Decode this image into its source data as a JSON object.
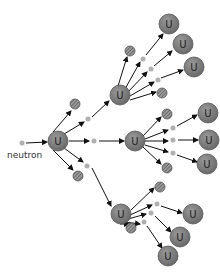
{
  "labels": {
    "neutron": "neutron"
  },
  "nucleus_symbol": "U",
  "colors": {
    "uranium_fill": "#7a7a7a",
    "uranium_stroke": "#555555",
    "neutron_fill": "#b0b0b0",
    "fragment_fill": "#8a8a8a",
    "arrow": "#111111"
  },
  "nodes": {
    "start_neutron": {
      "x": 22,
      "y": 143
    },
    "uranium": [
      {
        "id": "u0",
        "x": 58,
        "y": 141,
        "r": 10
      },
      {
        "id": "u1",
        "x": 120,
        "y": 95,
        "r": 10
      },
      {
        "id": "u2",
        "x": 135,
        "y": 141,
        "r": 10
      },
      {
        "id": "u3",
        "x": 121,
        "y": 214,
        "r": 10
      },
      {
        "id": "u4",
        "x": 169,
        "y": 24,
        "r": 10
      },
      {
        "id": "u5",
        "x": 183,
        "y": 44,
        "r": 10
      },
      {
        "id": "u6",
        "x": 194,
        "y": 67,
        "r": 10
      },
      {
        "id": "u7",
        "x": 208,
        "y": 113,
        "r": 10
      },
      {
        "id": "u8",
        "x": 209,
        "y": 140,
        "r": 10
      },
      {
        "id": "u9",
        "x": 207,
        "y": 164,
        "r": 10
      },
      {
        "id": "u10",
        "x": 193,
        "y": 214,
        "r": 10
      },
      {
        "id": "u11",
        "x": 180,
        "y": 237,
        "r": 10
      },
      {
        "id": "u12",
        "x": 168,
        "y": 256,
        "r": 10
      }
    ],
    "neutrons": [
      {
        "id": "n1",
        "x": 88,
        "y": 119
      },
      {
        "id": "n2",
        "x": 94,
        "y": 141
      },
      {
        "id": "n3",
        "x": 87,
        "y": 166
      },
      {
        "id": "n4",
        "x": 143,
        "y": 59
      },
      {
        "id": "n5",
        "x": 151,
        "y": 69
      },
      {
        "id": "n6",
        "x": 158,
        "y": 80
      },
      {
        "id": "n7",
        "x": 173,
        "y": 128
      },
      {
        "id": "n8",
        "x": 173,
        "y": 140
      },
      {
        "id": "n9",
        "x": 173,
        "y": 153
      },
      {
        "id": "n10",
        "x": 157,
        "y": 204
      },
      {
        "id": "n11",
        "x": 151,
        "y": 213
      },
      {
        "id": "n12",
        "x": 144,
        "y": 222
      }
    ],
    "fragments": [
      {
        "id": "f1",
        "x": 75,
        "y": 104
      },
      {
        "id": "f2",
        "x": 78,
        "y": 176
      },
      {
        "id": "f3",
        "x": 130,
        "y": 51
      },
      {
        "id": "f4",
        "x": 162,
        "y": 93
      },
      {
        "id": "f5",
        "x": 167,
        "y": 114
      },
      {
        "id": "f6",
        "x": 167,
        "y": 168
      },
      {
        "id": "f7",
        "x": 160,
        "y": 187
      },
      {
        "id": "f8",
        "x": 131,
        "y": 228
      }
    ]
  },
  "arrows": [
    [
      26,
      143,
      47,
      142
    ],
    [
      53,
      132,
      71,
      111
    ],
    [
      64,
      134,
      84,
      122
    ],
    [
      69,
      141,
      89,
      141
    ],
    [
      64,
      148,
      83,
      162
    ],
    [
      53,
      150,
      73,
      170
    ],
    [
      92,
      117,
      109,
      101
    ],
    [
      99,
      141,
      124,
      141
    ],
    [
      92,
      168,
      111,
      206
    ],
    [
      118,
      86,
      127,
      57
    ],
    [
      125,
      89,
      140,
      62
    ],
    [
      128,
      92,
      147,
      72
    ],
    [
      130,
      96,
      154,
      82
    ],
    [
      130,
      100,
      156,
      92
    ],
    [
      146,
      55,
      163,
      34
    ],
    [
      154,
      66,
      172,
      51
    ],
    [
      161,
      78,
      183,
      70
    ],
    [
      143,
      136,
      161,
      117
    ],
    [
      145,
      139,
      168,
      130
    ],
    [
      145,
      141,
      168,
      141
    ],
    [
      145,
      145,
      168,
      152
    ],
    [
      143,
      147,
      161,
      164
    ],
    [
      177,
      126,
      197,
      115
    ],
    [
      178,
      140,
      198,
      140
    ],
    [
      177,
      155,
      197,
      162
    ],
    [
      131,
      210,
      154,
      188
    ],
    [
      130,
      215,
      152,
      205
    ],
    [
      128,
      219,
      146,
      214
    ],
    [
      125,
      222,
      140,
      224
    ],
    [
      120,
      224,
      129,
      224
    ],
    [
      161,
      206,
      182,
      213
    ],
    [
      155,
      216,
      171,
      232
    ],
    [
      147,
      226,
      162,
      248
    ]
  ]
}
